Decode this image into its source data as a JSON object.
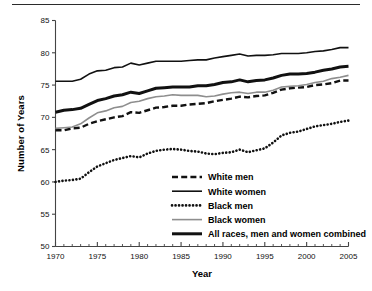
{
  "figure": {
    "has_top_rule": true,
    "axis_title_y": "Number of Years",
    "axis_title_x": "Year"
  },
  "chart_data": {
    "type": "line",
    "title": "",
    "subtitle": "",
    "xlabel": "Year",
    "ylabel": "Number of Years",
    "xlim": [
      1970,
      2005
    ],
    "ylim": [
      50,
      85
    ],
    "xticks": [
      1970,
      1975,
      1980,
      1985,
      1990,
      1995,
      2000,
      2005
    ],
    "xtick_labels": [
      "1970",
      "1975",
      "1980",
      "1985",
      "1990",
      "1995",
      "2000",
      "2005"
    ],
    "yticks": [
      50,
      55,
      60,
      65,
      70,
      75,
      80,
      85
    ],
    "ytick_labels": [
      "50",
      "55",
      "60",
      "65",
      "70",
      "75",
      "80",
      "85"
    ],
    "minor_xtick_interval": 1,
    "grid": false,
    "legend_position": "inside-lower-right",
    "x": [
      1970,
      1971,
      1972,
      1973,
      1974,
      1975,
      1976,
      1977,
      1978,
      1979,
      1980,
      1981,
      1982,
      1983,
      1984,
      1985,
      1986,
      1987,
      1988,
      1989,
      1990,
      1991,
      1992,
      1993,
      1994,
      1995,
      1996,
      1997,
      1998,
      1999,
      2000,
      2001,
      2002,
      2003,
      2004,
      2005
    ],
    "series": [
      {
        "name": "White men",
        "style": "dashed",
        "color": "#111111",
        "width": 2.4,
        "values": [
          68.0,
          68.0,
          68.3,
          68.4,
          69.0,
          69.4,
          69.7,
          70.0,
          70.2,
          70.8,
          70.7,
          71.1,
          71.5,
          71.6,
          71.8,
          71.8,
          72.0,
          72.1,
          72.2,
          72.5,
          72.7,
          72.9,
          73.2,
          73.1,
          73.3,
          73.4,
          73.8,
          74.3,
          74.5,
          74.6,
          74.7,
          75.0,
          75.1,
          75.3,
          75.7,
          75.7
        ]
      },
      {
        "name": "White women",
        "style": "solid-thin",
        "color": "#111111",
        "width": 1.6,
        "values": [
          75.6,
          75.6,
          75.6,
          75.9,
          76.7,
          77.2,
          77.3,
          77.7,
          77.8,
          78.4,
          78.1,
          78.4,
          78.7,
          78.7,
          78.7,
          78.7,
          78.8,
          78.9,
          78.9,
          79.2,
          79.4,
          79.6,
          79.8,
          79.5,
          79.6,
          79.6,
          79.7,
          79.9,
          79.9,
          79.9,
          80.0,
          80.2,
          80.3,
          80.5,
          80.8,
          80.8
        ]
      },
      {
        "name": "Black men",
        "style": "dotted",
        "color": "#111111",
        "width": 2.6,
        "values": [
          60.0,
          60.2,
          60.3,
          60.5,
          61.5,
          62.4,
          62.9,
          63.4,
          63.7,
          64.0,
          63.8,
          64.4,
          64.8,
          65.0,
          65.1,
          65.0,
          64.8,
          64.7,
          64.4,
          64.3,
          64.5,
          64.6,
          65.0,
          64.6,
          64.9,
          65.2,
          66.1,
          67.2,
          67.6,
          67.8,
          68.2,
          68.6,
          68.8,
          69.0,
          69.3,
          69.5
        ]
      },
      {
        "name": "Black women",
        "style": "solid-gray",
        "color": "#8e8e8e",
        "width": 1.6,
        "values": [
          68.3,
          68.4,
          68.5,
          69.0,
          69.9,
          70.7,
          71.0,
          71.5,
          71.7,
          72.3,
          72.5,
          72.9,
          73.2,
          73.3,
          73.5,
          73.4,
          73.4,
          73.4,
          73.2,
          73.3,
          73.6,
          73.8,
          73.9,
          73.7,
          73.9,
          73.9,
          74.2,
          74.7,
          74.8,
          74.9,
          75.1,
          75.4,
          75.6,
          76.0,
          76.2,
          76.5
        ]
      },
      {
        "name": "All races, men and women combined",
        "style": "solid-thick",
        "color": "#111111",
        "width": 3.0,
        "values": [
          70.8,
          71.1,
          71.2,
          71.4,
          72.0,
          72.6,
          72.9,
          73.3,
          73.5,
          73.9,
          73.7,
          74.1,
          74.5,
          74.6,
          74.7,
          74.7,
          74.7,
          74.9,
          74.9,
          75.1,
          75.4,
          75.5,
          75.8,
          75.5,
          75.7,
          75.8,
          76.1,
          76.5,
          76.7,
          76.7,
          76.8,
          77.0,
          77.3,
          77.5,
          77.8,
          77.9
        ]
      }
    ],
    "legend_entries": [
      {
        "label": "White men",
        "style": "dashed"
      },
      {
        "label": "White women",
        "style": "solid-thin"
      },
      {
        "label": "Black men",
        "style": "dotted"
      },
      {
        "label": "Black women",
        "style": "solid-gray"
      },
      {
        "label": "All races, men and women combined",
        "style": "solid-thick"
      }
    ]
  }
}
